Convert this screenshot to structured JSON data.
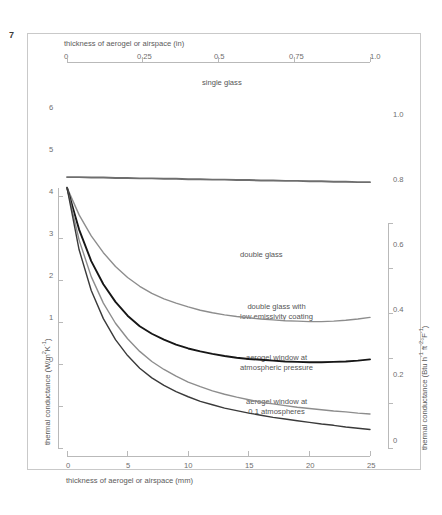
{
  "figure": {
    "number": "7"
  },
  "axes": {
    "top": {
      "title": "thickness of aerogel or airspace (in)",
      "ticks": [
        "0",
        "0.25",
        "0.5",
        "0.75",
        "1.0"
      ],
      "values": [
        0,
        0.25,
        0.5,
        0.75,
        1.0
      ]
    },
    "bottom": {
      "title": "thickness of aerogel or airspace (mm)",
      "ticks": [
        "0",
        "5",
        "10",
        "15",
        "20",
        "25"
      ],
      "values": [
        0,
        5,
        10,
        15,
        20,
        25
      ]
    },
    "left": {
      "title_prefix": "thermal conductance (W/m",
      "title_sup1": "2",
      "title_mid": "K",
      "title_sup2": "-1",
      "title_suffix": ")",
      "title_plain": "thermal conductance (W/m2K-1)",
      "ticks": [
        "0",
        "1",
        "2",
        "3",
        "4",
        "5",
        "6"
      ],
      "values": [
        0,
        1,
        2,
        3,
        4,
        5,
        6
      ]
    },
    "right": {
      "title_plain": "thermal conductance (Btu h-1 ft-2 °F-1)",
      "t1": "thermal conductance (Btu h",
      "s1": "-1",
      "t2": " ft",
      "s2": "-2",
      "t3": "°F",
      "s3": "-1",
      "t4": ")",
      "ticks": [
        "0",
        "0.2",
        "0.4",
        "0.6",
        "0.8",
        "1.0"
      ],
      "values": [
        0,
        0.2,
        0.4,
        0.6,
        0.8,
        1.0
      ]
    }
  },
  "labels": {
    "single_glass": "single glass",
    "double_glass": "double glass",
    "double_glass_lowe_line1": "double glass with",
    "double_glass_lowe_line2": "low emissivity coating",
    "aerogel_atm_line1": "aerogel window at",
    "aerogel_atm_line2": "atmospheric pressure",
    "aerogel_01_line1": "aerogel window at",
    "aerogel_01_line2": "0.1 atmospheres"
  },
  "colors": {
    "single_glass": "#6e6e6e",
    "double_glass": "#8d8d8d",
    "double_glass_lowe": "#161616",
    "aerogel_atm": "#8d8d8d",
    "aerogel_01": "#3a3a3a",
    "axis": "#b9b9b9",
    "frame": "#c9c9c9",
    "text": "#5a5a5a"
  },
  "chart_data": {
    "type": "line",
    "title": "",
    "xlabel": "thickness of aerogel or airspace (mm)",
    "ylabel": "thermal conductance (W/m2K-1)",
    "xlim": [
      0,
      25
    ],
    "ylim": [
      0,
      6.6
    ],
    "xlim_secondary_in": [
      0,
      1.0
    ],
    "ylim_secondary_btu": [
      0,
      1.16
    ],
    "grid": false,
    "legend": "inline-annotations",
    "x": [
      0,
      1,
      2,
      3,
      4,
      5,
      6,
      7,
      8,
      9,
      10,
      11,
      12,
      13,
      14,
      15,
      16,
      17,
      18,
      19,
      20,
      21,
      22,
      23,
      24,
      25
    ],
    "series": [
      {
        "name": "single glass",
        "color": "#6e6e6e",
        "values": [
          6.45,
          6.45,
          6.44,
          6.44,
          6.43,
          6.43,
          6.42,
          6.42,
          6.41,
          6.41,
          6.4,
          6.4,
          6.39,
          6.39,
          6.38,
          6.38,
          6.37,
          6.37,
          6.36,
          6.36,
          6.35,
          6.35,
          6.34,
          6.34,
          6.33,
          6.33
        ]
      },
      {
        "name": "double glass",
        "color": "#8d8d8d",
        "values": [
          6.2,
          5.55,
          5.05,
          4.65,
          4.32,
          4.06,
          3.85,
          3.68,
          3.55,
          3.45,
          3.36,
          3.28,
          3.22,
          3.17,
          3.13,
          3.1,
          3.07,
          3.05,
          3.03,
          3.02,
          3.01,
          3.01,
          3.02,
          3.04,
          3.07,
          3.11
        ]
      },
      {
        "name": "double glass with low emissivity coating",
        "color": "#161616",
        "values": [
          6.2,
          5.2,
          4.45,
          3.9,
          3.48,
          3.15,
          2.9,
          2.72,
          2.58,
          2.46,
          2.37,
          2.3,
          2.24,
          2.19,
          2.15,
          2.12,
          2.1,
          2.08,
          2.06,
          2.05,
          2.04,
          2.04,
          2.05,
          2.06,
          2.08,
          2.11
        ]
      },
      {
        "name": "aerogel window at atmospheric pressure",
        "color": "#8d8d8d",
        "values": [
          6.2,
          4.95,
          4.08,
          3.45,
          2.97,
          2.6,
          2.3,
          2.06,
          1.87,
          1.71,
          1.57,
          1.46,
          1.36,
          1.28,
          1.21,
          1.15,
          1.09,
          1.05,
          1.01,
          0.97,
          0.94,
          0.91,
          0.88,
          0.86,
          0.83,
          0.81
        ]
      },
      {
        "name": "aerogel window at 0.1 atmospheres",
        "color": "#3a3a3a",
        "values": [
          6.2,
          4.72,
          3.75,
          3.08,
          2.58,
          2.2,
          1.9,
          1.67,
          1.49,
          1.34,
          1.22,
          1.11,
          1.03,
          0.95,
          0.89,
          0.83,
          0.78,
          0.73,
          0.69,
          0.65,
          0.61,
          0.57,
          0.54,
          0.5,
          0.47,
          0.44
        ]
      }
    ]
  }
}
